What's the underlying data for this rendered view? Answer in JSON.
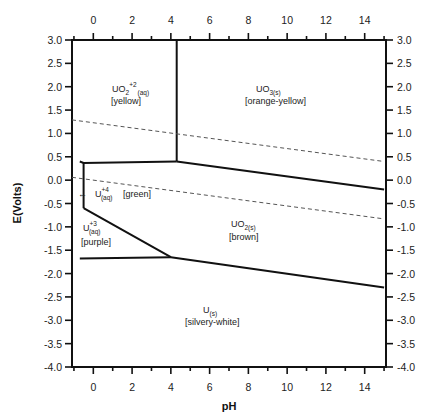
{
  "chart_data": {
    "type": "line",
    "title": "",
    "xlabel": "pH",
    "ylabel": "E(Volts)",
    "xlim": [
      -1.1,
      15.1
    ],
    "ylim": [
      -4.0,
      3.0
    ],
    "x_ticks_major": [
      0,
      2,
      4,
      6,
      8,
      10,
      12,
      14
    ],
    "x_tick_labels": [
      "0",
      "2",
      "4",
      "6",
      "8",
      "10",
      "12",
      "14"
    ],
    "y_ticks": [
      3.0,
      2.5,
      2.0,
      1.5,
      1.0,
      0.5,
      0.0,
      -0.5,
      -1.0,
      -1.5,
      -2.0,
      -2.5,
      -3.0,
      -3.5,
      -4.0
    ],
    "y_tick_labels": [
      "3.0",
      "2.5",
      "2.0",
      "1.5",
      "1.0",
      "0.5",
      "0.0",
      "-0.5",
      "-1.0",
      "-1.5",
      "-2.0",
      "-2.5",
      "-3.0",
      "-3.5",
      "-4.0"
    ],
    "grid": false,
    "mirror_axes": true,
    "boundaries": [
      {
        "name": "UO2+2/UO3 vertical",
        "style": "solid",
        "points": [
          [
            4.3,
            3.0
          ],
          [
            4.3,
            0.4
          ]
        ]
      },
      {
        "name": "UO2+2/U+4 top",
        "style": "solid",
        "points": [
          [
            -0.7,
            0.4
          ],
          [
            -0.5,
            0.37
          ],
          [
            4.3,
            0.4
          ]
        ]
      },
      {
        "name": "UO3/UO2",
        "style": "solid",
        "points": [
          [
            4.3,
            0.4
          ],
          [
            15.0,
            -0.2
          ]
        ]
      },
      {
        "name": "U+4/U+3 vertical",
        "style": "solid",
        "points": [
          [
            -0.5,
            0.37
          ],
          [
            -0.5,
            -0.6
          ]
        ]
      },
      {
        "name": "U+4/UO2 & U+3/UO2 diagonal",
        "style": "solid",
        "points": [
          [
            -0.5,
            -0.6
          ],
          [
            4.0,
            -1.65
          ]
        ]
      },
      {
        "name": "U+3/U",
        "style": "solid",
        "points": [
          [
            -0.7,
            -1.68
          ],
          [
            4.0,
            -1.65
          ]
        ]
      },
      {
        "name": "UO2/U",
        "style": "solid",
        "points": [
          [
            4.0,
            -1.65
          ],
          [
            15.0,
            -2.3
          ]
        ]
      },
      {
        "name": "O2/H2O",
        "style": "dashed",
        "points": [
          [
            -1.1,
            1.29
          ],
          [
            15.0,
            0.4
          ]
        ]
      },
      {
        "name": "H2O/H2",
        "style": "dashed",
        "points": [
          [
            -1.1,
            0.06
          ],
          [
            15.0,
            -0.83
          ]
        ]
      }
    ],
    "annotations": [
      {
        "species": "UO2+2(aq)",
        "color_label": "[yellow]",
        "x": 1.6,
        "y": 1.9
      },
      {
        "species": "UO3(s)",
        "color_label": "[orange-yellow]",
        "x": 9.4,
        "y": 1.9
      },
      {
        "species": "U+4(aq)",
        "color_label": "[green]",
        "x": 1.5,
        "y": -0.3
      },
      {
        "species": "U+3(aq)",
        "color_label": "[purple]",
        "x": 0.3,
        "y": -1.15
      },
      {
        "species": "UO2(s)",
        "color_label": "[brown]",
        "x": 6.3,
        "y": -1.15
      },
      {
        "species": "U(s)",
        "color_label": "[silvery-white]",
        "x": 5.8,
        "y": -3.0
      }
    ]
  },
  "axes": {
    "x_title": "pH",
    "y_title": "E(Volts)"
  },
  "regions": {
    "uo2_aq": {
      "base": "UO",
      "sub1": "2",
      "sup": "+2",
      "sub2": "(aq)",
      "color": "[yellow]"
    },
    "uo3": {
      "base": "UO",
      "sub": "3(s)",
      "color": "[orange-yellow]"
    },
    "u4": {
      "base": "U",
      "sup": "+4",
      "sub": "(aq)",
      "color": "[green]"
    },
    "u3": {
      "base": "U",
      "sup": "+3",
      "sub": "(aq)",
      "color": "[purple]"
    },
    "uo2_s": {
      "base": "UO",
      "sub": "2(s)",
      "color": "[brown]"
    },
    "u_s": {
      "base": "U",
      "sub": "(s)",
      "color": "[silvery-white]"
    }
  }
}
